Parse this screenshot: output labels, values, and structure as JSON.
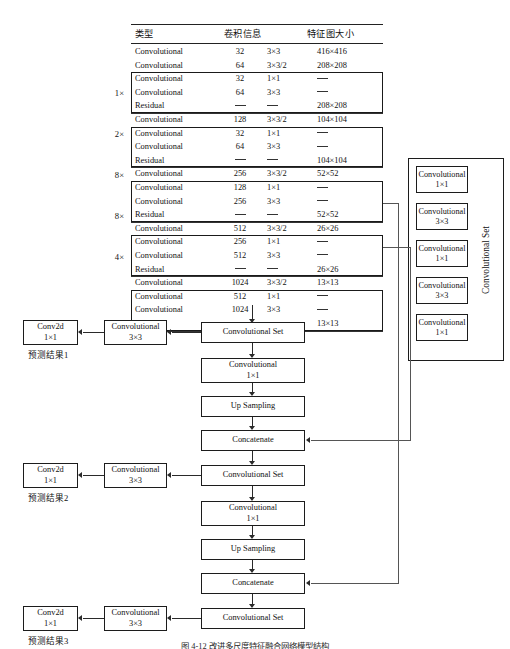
{
  "figure": {
    "caption": "图 4-12  改进多尺度特征融合网络模型结构"
  },
  "table": {
    "headers": [
      "类型",
      "卷积信息",
      "特征图大小"
    ],
    "rows": [
      {
        "type": "Convolutional",
        "filters": "32",
        "size": "3×3",
        "out": "416×416"
      },
      {
        "type": "Convolutional",
        "filters": "64",
        "size": "3×3/2",
        "out": "208×208"
      },
      {
        "type": "Convolutional",
        "filters": "32",
        "size": "1×1",
        "out": "—"
      },
      {
        "type": "Convolutional",
        "filters": "64",
        "size": "3×3",
        "out": "—"
      },
      {
        "type": "Residual",
        "filters": "—",
        "size": "—",
        "out": "208×208"
      },
      {
        "type": "Convolutional",
        "filters": "128",
        "size": "3×3/2",
        "out": "104×104"
      },
      {
        "type": "Convolutional",
        "filters": "32",
        "size": "1×1",
        "out": "—"
      },
      {
        "type": "Convolutional",
        "filters": "64",
        "size": "3×3",
        "out": "—"
      },
      {
        "type": "Residual",
        "filters": "—",
        "size": "—",
        "out": "104×104"
      },
      {
        "type": "Convolutional",
        "filters": "256",
        "size": "3×3/2",
        "out": "52×52"
      },
      {
        "type": "Convolutional",
        "filters": "128",
        "size": "1×1",
        "out": "—"
      },
      {
        "type": "Convolutional",
        "filters": "256",
        "size": "3×3",
        "out": "—"
      },
      {
        "type": "Residual",
        "filters": "—",
        "size": "—",
        "out": "52×52"
      },
      {
        "type": "Convolutional",
        "filters": "512",
        "size": "3×3/2",
        "out": "26×26"
      },
      {
        "type": "Convolutional",
        "filters": "256",
        "size": "1×1",
        "out": "—"
      },
      {
        "type": "Convolutional",
        "filters": "512",
        "size": "3×3",
        "out": "—"
      },
      {
        "type": "Residual",
        "filters": "—",
        "size": "—",
        "out": "26×26"
      },
      {
        "type": "Convolutional",
        "filters": "1024",
        "size": "3×3/2",
        "out": "13×13"
      },
      {
        "type": "Convolutional",
        "filters": "512",
        "size": "1×1",
        "out": "—"
      },
      {
        "type": "Convolutional",
        "filters": "1024",
        "size": "3×3",
        "out": "—"
      },
      {
        "type": "Residual",
        "filters": "—",
        "size": "—",
        "out": "13×13"
      }
    ],
    "multipliers": [
      "1×",
      "2×",
      "8×",
      "8×",
      "4×"
    ]
  },
  "conv_set_panel": {
    "label": "Convolutional Set",
    "blocks": [
      {
        "name": "Convolutional",
        "kernel": "1×1"
      },
      {
        "name": "Convolutional",
        "kernel": "3×3"
      },
      {
        "name": "Convolutional",
        "kernel": "1×1"
      },
      {
        "name": "Convolutional",
        "kernel": "3×3"
      },
      {
        "name": "Convolutional",
        "kernel": "1×1"
      }
    ]
  },
  "flow": {
    "branch1": {
      "conv_set": "Convolutional Set",
      "conv3x3_name": "Convolutional",
      "conv3x3_kernel": "3×3",
      "conv2d_name": "Conv2d",
      "conv2d_kernel": "1×1",
      "prediction": "预测结果1",
      "conv1x1_name": "Convolutional",
      "conv1x1_kernel": "1×1",
      "upsampling": "Up Sampling",
      "concatenate": "Concatenate"
    },
    "branch2": {
      "conv_set": "Convolutional Set",
      "conv3x3_name": "Convolutional",
      "conv3x3_kernel": "3×3",
      "conv2d_name": "Conv2d",
      "conv2d_kernel": "1×1",
      "prediction": "预测结果2",
      "conv1x1_name": "Convolutional",
      "conv1x1_kernel": "1×1",
      "upsampling": "Up Sampling",
      "concatenate": "Concatenate"
    },
    "branch3": {
      "conv_set": "Convolutional Set",
      "conv3x3_name": "Convolutional",
      "conv3x3_kernel": "3×3",
      "conv2d_name": "Conv2d",
      "conv2d_kernel": "1×1",
      "prediction": "预测结果3"
    }
  }
}
